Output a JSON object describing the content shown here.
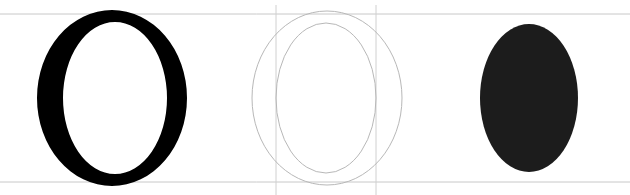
{
  "colors": {
    "background": "#ffffff",
    "glyph_fill": "#000000",
    "outline_stroke": "#b8b8b8",
    "guide_line": "#c8c8c8",
    "oval_fill": "#1c1c1c"
  },
  "guides": {
    "baseline_y": 182,
    "cap_height_y": 14,
    "vertical_guides_x": [
      276,
      376
    ]
  },
  "panels": [
    {
      "name": "filled-glyph",
      "label": "O",
      "outer": {
        "cx": 112,
        "cy": 98,
        "rx": 75,
        "ry": 88
      },
      "inner": {
        "cx": 115,
        "cy": 98,
        "rx": 52,
        "ry": 76
      }
    },
    {
      "name": "outline-glyph",
      "label": "O",
      "outer": {
        "cx": 327,
        "cy": 98,
        "rx": 75,
        "ry": 87
      },
      "inner": {
        "cx": 326,
        "cy": 98,
        "rx": 50,
        "ry": 75
      }
    },
    {
      "name": "filled-oval",
      "outer": {
        "cx": 529,
        "cy": 98,
        "rx": 49,
        "ry": 74
      }
    }
  ]
}
